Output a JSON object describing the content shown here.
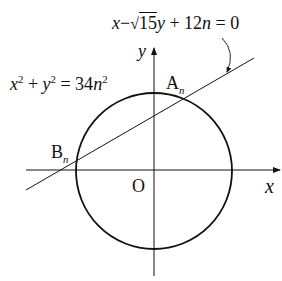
{
  "diagram": {
    "line_equation": {
      "x": "x",
      "minus": "−",
      "sqrt_arg": "15",
      "rest_y": "y",
      "rest": " + 12",
      "n": "n",
      "eq": " = 0"
    },
    "circle_equation": {
      "x": "x",
      "p1": "2",
      "plus": " + ",
      "y": "y",
      "p2": "2",
      "eq": " = 34",
      "n": "n",
      "p3": "2"
    },
    "labels": {
      "A": "A",
      "A_sub": "n",
      "B": "B",
      "B_sub": "n",
      "origin": "O",
      "x_axis": "x",
      "y_axis": "y"
    },
    "colors": {
      "stroke": "#111111",
      "background": "#ffffff"
    }
  }
}
